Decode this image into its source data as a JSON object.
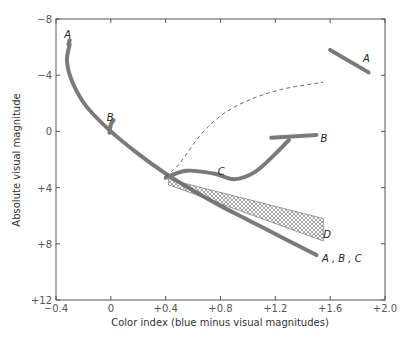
{
  "chart_data": {
    "type": "line",
    "title": "",
    "xlabel": "Color index (blue minus visual magnitudes)",
    "ylabel": "Absolute visual magnitude",
    "xlim": [
      -0.4,
      2.0
    ],
    "ylim": [
      12,
      -8
    ],
    "y_inverted": true,
    "grid": false,
    "xticks": [
      -0.4,
      0,
      0.4,
      0.8,
      1.2,
      1.6,
      2.0
    ],
    "xtick_labels": [
      "−0.4",
      "0",
      "+0.4",
      "+0.8",
      "+1.2",
      "+1.6",
      "+2.0"
    ],
    "yticks": [
      -8,
      -4,
      0,
      4,
      8,
      12
    ],
    "ytick_labels": [
      "−8",
      "−4",
      "0",
      "+4",
      "+8",
      "+12"
    ],
    "colors": {
      "curve": "#7a7a7a",
      "axis": "#555555",
      "dashed": "#444444",
      "hatch": "#666666"
    },
    "series": [
      {
        "name": "A, B, C main sequence",
        "label": "A , B , C",
        "points": [
          [
            -0.3,
            -6.2
          ],
          [
            -0.32,
            -5.0
          ],
          [
            -0.28,
            -3.5
          ],
          [
            -0.18,
            -1.8
          ],
          [
            0,
            0
          ],
          [
            0.2,
            1.6
          ],
          [
            0.4,
            3.0
          ],
          [
            0.6,
            4.2
          ],
          [
            0.8,
            5.3
          ],
          [
            1.0,
            6.3
          ],
          [
            1.2,
            7.3
          ],
          [
            1.4,
            8.3
          ],
          [
            1.5,
            8.8
          ]
        ],
        "label_pos": [
          1.54,
          9.0
        ]
      },
      {
        "name": "A upper",
        "label": "A",
        "points": [
          [
            -0.31,
            -6.2
          ],
          [
            -0.3,
            -6.5
          ]
        ],
        "label_pos": [
          -0.34,
          -6.9
        ]
      },
      {
        "name": "A giant branch",
        "label": "A",
        "points": [
          [
            1.6,
            -5.8
          ],
          [
            1.88,
            -4.2
          ]
        ],
        "label_pos": [
          1.84,
          -5.2
        ]
      },
      {
        "name": "B turnoff",
        "label": "B",
        "points": [
          [
            -0.01,
            0.1
          ],
          [
            0.0,
            -0.5
          ],
          [
            0.02,
            -0.8
          ]
        ],
        "label_pos": [
          -0.03,
          -1.0
        ]
      },
      {
        "name": "B giant branch",
        "label": "B",
        "points": [
          [
            1.17,
            0.45
          ],
          [
            1.5,
            0.25
          ]
        ],
        "label_pos": [
          1.53,
          0.45
        ]
      },
      {
        "name": "C branch",
        "label": "C",
        "points": [
          [
            0.4,
            3.3
          ],
          [
            0.55,
            2.8
          ],
          [
            0.75,
            3.0
          ],
          [
            0.9,
            3.4
          ],
          [
            1.05,
            2.9
          ],
          [
            1.2,
            1.6
          ],
          [
            1.3,
            0.6
          ]
        ],
        "label_pos": [
          0.78,
          2.8
        ]
      },
      {
        "name": "dashed evolutionary track",
        "label": "",
        "points": [
          [
            0.4,
            3.2
          ],
          [
            0.5,
            2.3
          ],
          [
            0.65,
            0.3
          ],
          [
            0.8,
            -1.1
          ],
          [
            1.0,
            -2.2
          ],
          [
            1.25,
            -3.0
          ],
          [
            1.55,
            -3.5
          ]
        ],
        "dashed": true
      },
      {
        "name": "D region",
        "label": "D",
        "region": true,
        "points": [
          [
            0.42,
            3.4
          ],
          [
            1.55,
            6.2
          ],
          [
            1.55,
            7.8
          ],
          [
            0.42,
            3.8
          ]
        ],
        "label_pos": [
          1.55,
          7.3
        ]
      }
    ]
  }
}
